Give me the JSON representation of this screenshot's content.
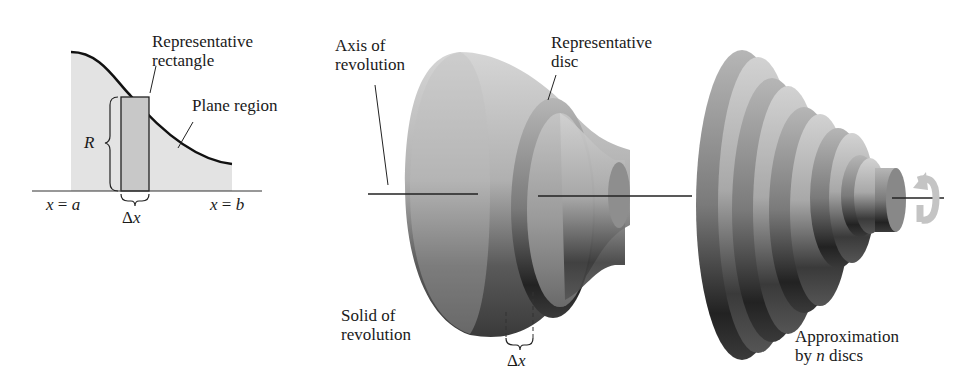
{
  "figure": {
    "left_panel": {
      "title": "Plane region with representative rectangle",
      "labels": {
        "rep_rect_line1": "Representative",
        "rep_rect_line2": "rectangle",
        "plane_region": "Plane region",
        "radius": "R",
        "x_a_var": "x",
        "x_a_eq": " = ",
        "x_a_val": "a",
        "x_b_var": "x",
        "x_b_eq": " = ",
        "x_b_val": "b",
        "delta": "Δ",
        "delta_var": "x"
      }
    },
    "middle_panel": {
      "title": "Solid of revolution with representative disc",
      "labels": {
        "axis_line1": "Axis of",
        "axis_line2": "revolution",
        "disc_line1": "Representative",
        "disc_line2": "disc",
        "solid_line1": "Solid of",
        "solid_line2": "revolution",
        "delta": "Δ",
        "delta_var": "x"
      }
    },
    "right_panel": {
      "title": "Approximation by discs",
      "labels": {
        "approx_line1": "Approximation",
        "approx_pre": "by ",
        "approx_n": "n",
        "approx_post": " discs"
      },
      "disc_count": 6
    },
    "icons": {
      "rotation": "rotation-arrow-icon"
    },
    "colors": {
      "region_fill": "#e3e3e3",
      "rect_fill": "#c8c8c8",
      "curve": "#111111",
      "solid_light": "#c9c9c9",
      "solid_dark": "#2a2a2a",
      "rotation_arrow": "#c4c4c4"
    }
  }
}
